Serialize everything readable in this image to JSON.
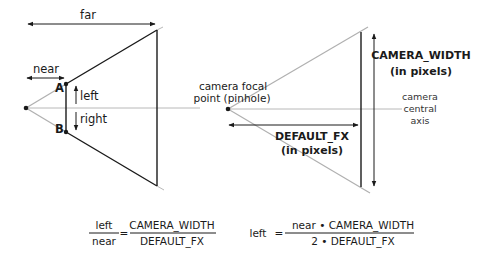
{
  "left_diagram": {
    "far_label": "far",
    "near_label": "near",
    "point_a": "A",
    "point_b": "B",
    "left_label": "left",
    "right_label": "right"
  },
  "right_diagram": {
    "focal_point_line1": "camera focal",
    "focal_point_line2": "point (pinhole)",
    "camera_width_line1": "CAMERA_WIDTH",
    "camera_width_line2": "(in pixels)",
    "central_axis_line1": "camera",
    "central_axis_line2": "central",
    "central_axis_line3": "axis",
    "default_fx_line1": "DEFAULT_FX",
    "default_fx_line2": "(in pixels)"
  },
  "equations": {
    "eq1": {
      "lhs_num": "left",
      "lhs_den": "near",
      "equals": "=",
      "rhs_num": "CAMERA_WIDTH",
      "rhs_den": "DEFAULT_FX"
    },
    "eq2": {
      "lhs": "left",
      "equals": "=",
      "rhs_num": "near • CAMERA_WIDTH",
      "rhs_den": "2 • DEFAULT_FX"
    }
  },
  "colors": {
    "stroke_dark": "#1a1a1a",
    "stroke_gray": "#b0b0b0",
    "background": "#ffffff"
  }
}
